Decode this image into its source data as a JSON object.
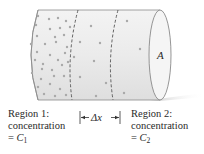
{
  "figure": {
    "area_label": "A",
    "delta_label": "Δx",
    "region1": {
      "line1": "Region 1:",
      "line2": "concentration",
      "eq_prefix": "= ",
      "symbol": "C",
      "subscript": "1"
    },
    "region2": {
      "line1": "Region 2:",
      "line2": "concentration",
      "eq_prefix": "= ",
      "symbol": "C",
      "subscript": "2"
    },
    "colors": {
      "cylinder_fill": "#ececec",
      "cylinder_edge": "#8a8a8a",
      "end_face": "#f4f4f4",
      "particles": "#a8a8a8",
      "dashed_line": "#555555",
      "shadow": "#d6d6d6",
      "text": "#2a2a2a"
    }
  }
}
